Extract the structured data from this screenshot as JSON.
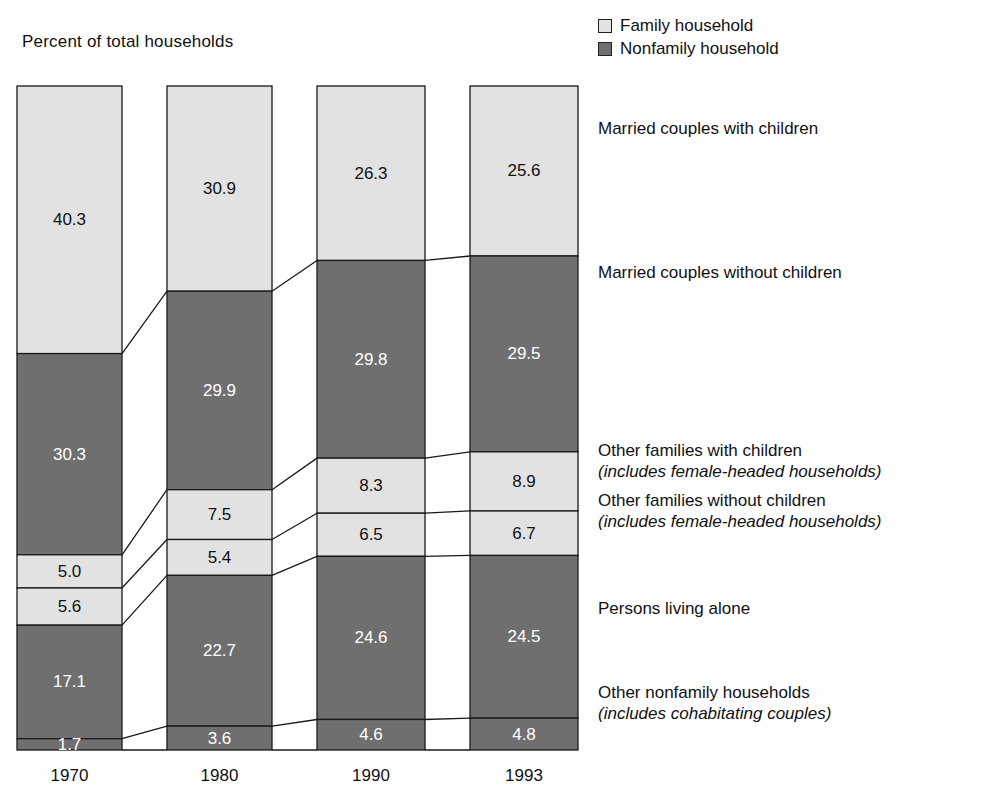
{
  "chart_data": {
    "type": "bar",
    "title": "Percent of total households",
    "xlabel": "",
    "ylabel": "",
    "ylim": [
      0,
      100
    ],
    "grid": false,
    "stacked": true,
    "legend_position": "top-right",
    "categories": [
      "1970",
      "1980",
      "1990",
      "1993"
    ],
    "legend": [
      {
        "label": "Family household",
        "color": "#e2e2e2",
        "key": "family"
      },
      {
        "label": "Nonfamily household",
        "color": "#6f6f6f",
        "key": "nonfamily"
      }
    ],
    "series": [
      {
        "name": "Married couples with children",
        "household_type": "family",
        "values": [
          40.3,
          30.9,
          26.3,
          25.6
        ]
      },
      {
        "name": "Married couples without children",
        "household_type": "nonfamily",
        "values": [
          30.3,
          29.9,
          29.8,
          29.5
        ]
      },
      {
        "name": "Other families with children",
        "household_type": "family",
        "values": [
          5.0,
          7.5,
          8.3,
          8.9
        ]
      },
      {
        "name": "Other families without children",
        "household_type": "family",
        "values": [
          5.6,
          5.4,
          6.5,
          6.7
        ]
      },
      {
        "name": "Persons living alone",
        "household_type": "nonfamily",
        "values": [
          17.1,
          22.7,
          24.6,
          24.5
        ]
      },
      {
        "name": "Other nonfamily households",
        "household_type": "nonfamily",
        "values": [
          1.7,
          3.6,
          4.6,
          4.8
        ]
      }
    ]
  },
  "legend": {
    "family_label": "Family household",
    "nonfamily_label": "Nonfamily household"
  },
  "title": "Percent of total households",
  "categories_labels": [
    {
      "main": "Married couples with children",
      "sub": ""
    },
    {
      "main": "Married couples without children",
      "sub": ""
    },
    {
      "main": "Other families with children",
      "sub": "(includes female-headed households)"
    },
    {
      "main": "Other families without children",
      "sub": "(includes female-headed households)"
    },
    {
      "main": "Persons living alone",
      "sub": ""
    },
    {
      "main": "Other nonfamily households",
      "sub": "(includes cohabitating couples)"
    }
  ],
  "years": [
    "1970",
    "1980",
    "1990",
    "1993"
  ],
  "colors": {
    "family": "#e2e2e2",
    "nonfamily": "#6f6f6f",
    "outline": "#1a1a1a",
    "label_on_dark": "#ffffff",
    "label_on_light": "#111111"
  }
}
